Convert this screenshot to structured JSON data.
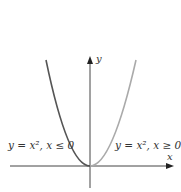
{
  "diagram": {
    "axes": {
      "x_label": "x",
      "y_label": "y",
      "color": "#444444"
    },
    "curves": [
      {
        "name": "left-branch",
        "label": "y = x², x ≤ 0",
        "color": "#555555"
      },
      {
        "name": "right-branch",
        "label": "y = x², x ≥ 0",
        "color": "#aaaaaa"
      }
    ]
  }
}
